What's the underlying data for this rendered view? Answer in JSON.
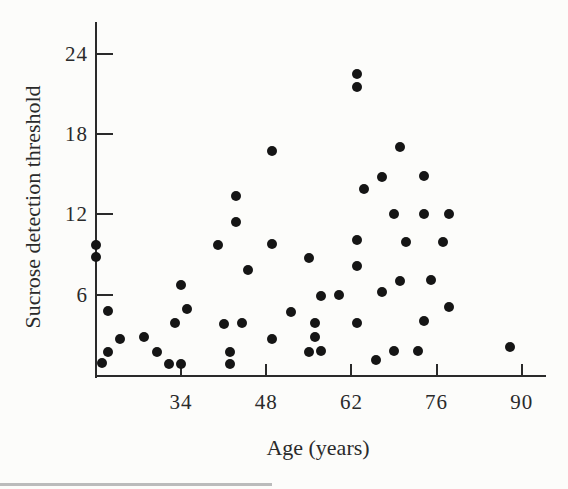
{
  "figure": {
    "paper_color": "#fcfcfa",
    "ink_color": "#2a2a2a",
    "dot_color": "#151515",
    "artifact_color": "#a6a6a6"
  },
  "chart_data": {
    "type": "scatter",
    "title": "",
    "xlabel": "Age (years)",
    "ylabel": "Sucrose detection threshold",
    "x_ticks": [
      34,
      48,
      62,
      76,
      90
    ],
    "y_ticks": [
      6,
      12,
      18,
      24
    ],
    "xlim": [
      20,
      94
    ],
    "ylim": [
      0,
      26.5
    ],
    "grid": false,
    "legend": null,
    "points": [
      [
        20,
        9.7
      ],
      [
        20,
        8.8
      ],
      [
        21,
        0.9
      ],
      [
        22,
        1.7
      ],
      [
        22,
        4.8
      ],
      [
        24,
        2.7
      ],
      [
        28,
        2.8
      ],
      [
        30,
        1.7
      ],
      [
        32,
        0.8
      ],
      [
        34,
        0.8
      ],
      [
        33,
        3.9
      ],
      [
        34,
        6.7
      ],
      [
        35,
        4.9
      ],
      [
        40,
        9.7
      ],
      [
        41,
        3.8
      ],
      [
        42,
        1.7
      ],
      [
        42,
        0.8
      ],
      [
        43,
        13.4
      ],
      [
        43,
        11.4
      ],
      [
        44,
        3.9
      ],
      [
        45,
        7.8
      ],
      [
        49,
        16.7
      ],
      [
        49,
        9.8
      ],
      [
        49,
        2.7
      ],
      [
        52,
        4.7
      ],
      [
        55,
        8.7
      ],
      [
        55,
        1.7
      ],
      [
        56,
        2.8
      ],
      [
        56,
        3.9
      ],
      [
        57,
        5.9
      ],
      [
        57,
        1.8
      ],
      [
        60,
        6.0
      ],
      [
        63,
        22.5
      ],
      [
        63,
        21.5
      ],
      [
        63,
        10.1
      ],
      [
        63,
        8.1
      ],
      [
        63,
        3.9
      ],
      [
        64,
        13.9
      ],
      [
        66,
        1.1
      ],
      [
        67,
        14.8
      ],
      [
        67,
        6.2
      ],
      [
        69,
        1.8
      ],
      [
        69,
        12.0
      ],
      [
        70,
        7.0
      ],
      [
        70,
        17.0
      ],
      [
        71,
        9.9
      ],
      [
        73,
        1.8
      ],
      [
        74,
        12.0
      ],
      [
        74,
        14.9
      ],
      [
        74,
        4.0
      ],
      [
        75,
        7.1
      ],
      [
        77,
        9.9
      ],
      [
        78,
        12.0
      ],
      [
        78,
        5.1
      ],
      [
        88,
        2.1
      ]
    ]
  }
}
